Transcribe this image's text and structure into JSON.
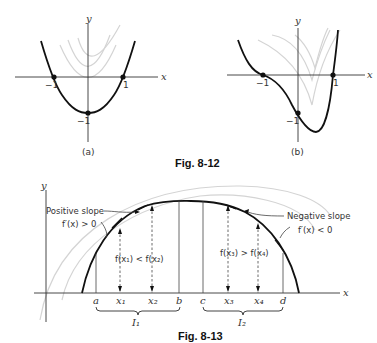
{
  "fig812": {
    "caption": "Fig. 8-12",
    "a": {
      "label": "(a)",
      "xaxis": "x",
      "yaxis": "y",
      "tick_neg1_x": "−1",
      "tick_pos1_x": "1",
      "tick_neg1_y": "−1",
      "points": [
        [
          -1,
          0
        ],
        [
          1,
          0
        ],
        [
          0,
          -1
        ]
      ]
    },
    "b": {
      "label": "(b)",
      "xaxis": "x",
      "yaxis": "y",
      "tick_neg1_x": "−1",
      "tick_pos1_x": "1",
      "tick_neg1_y": "−1",
      "points": [
        [
          -1,
          0
        ],
        [
          1,
          0
        ],
        [
          0,
          -1
        ]
      ]
    }
  },
  "fig813": {
    "caption": "Fig. 8-13",
    "xaxis": "x",
    "yaxis": "y",
    "positive_slope": "Positive slope",
    "positive_deriv": "f′(x) > 0",
    "negative_slope": "Negative slope",
    "negative_deriv": "f′(x) < 0",
    "ineq1": "f(x₁) < f(x₂)",
    "ineq2": "f(x₃) > f(x₄)",
    "ticks": [
      "a",
      "x₁",
      "x₂",
      "b",
      "c",
      "x₃",
      "x₄",
      "d"
    ],
    "interval1": "I₁",
    "interval2": "I₂"
  }
}
